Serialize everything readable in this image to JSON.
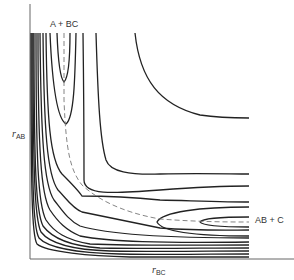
{
  "figure": {
    "labels": {
      "reactants": "A + BC",
      "products": "AB + C",
      "y_axis_var": "r",
      "y_axis_sub": "AB",
      "x_axis_var": "r",
      "x_axis_sub": "BC"
    },
    "colors": {
      "contour": "#222222",
      "axis": "#555555",
      "reaction_path": "#777777",
      "text": "#333333"
    }
  }
}
